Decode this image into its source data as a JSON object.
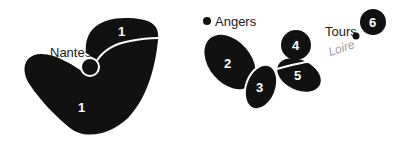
{
  "map": {
    "colors": {
      "region_fill": "#111111",
      "label_fill": "#ffffff",
      "city_text": "#1a1a1a",
      "river_text": "#9a9a9a",
      "background": "#ffffff"
    },
    "regions": [
      {
        "id": "region-1-north",
        "label": "1"
      },
      {
        "id": "region-1-south",
        "label": "1"
      },
      {
        "id": "region-2",
        "label": "2"
      },
      {
        "id": "region-3",
        "label": "3"
      },
      {
        "id": "region-4",
        "label": "4"
      },
      {
        "id": "region-5",
        "label": "5"
      },
      {
        "id": "region-6",
        "label": "6"
      }
    ],
    "cities": [
      {
        "name": "Nantes"
      },
      {
        "name": "Angers"
      },
      {
        "name": "Tours"
      }
    ],
    "rivers": [
      {
        "name": "Loire"
      }
    ]
  }
}
